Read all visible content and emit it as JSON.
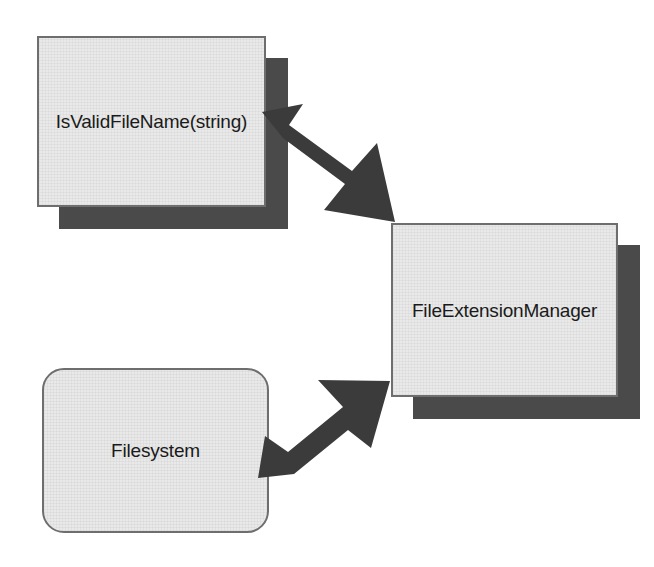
{
  "diagram": {
    "type": "component-interaction-diagram",
    "background_color": "#ffffff",
    "node_fill_color": "#e9e9e9",
    "node_border_color": "#6e6e6e",
    "shadow_color": "#4a4a4a",
    "arrow_color": "#3b3b3b",
    "text_color": "#1a1a1a",
    "nodes": [
      {
        "id": "isvalidfilename",
        "label": "IsValidFileName(string)",
        "shape": "rectangle",
        "has_drop_shadow": true
      },
      {
        "id": "fileextensionmanager",
        "label": "FileExtensionManager",
        "shape": "rectangle",
        "has_drop_shadow": true
      },
      {
        "id": "filesystem",
        "label": "Filesystem",
        "shape": "rounded-rectangle",
        "has_drop_shadow": false
      }
    ],
    "connectors": [
      {
        "id": "isvalidfilename-to-fileextensionmanager",
        "from": "isvalidfilename",
        "to": "fileextensionmanager",
        "style": "double-headed-arrow",
        "direction": "bidirectional",
        "orientation": "diagonal-down-right"
      },
      {
        "id": "filesystem-to-fileextensionmanager",
        "from": "filesystem",
        "to": "fileextensionmanager",
        "style": "double-headed-arrow",
        "direction": "bidirectional",
        "orientation": "diagonal-up-right"
      }
    ]
  }
}
